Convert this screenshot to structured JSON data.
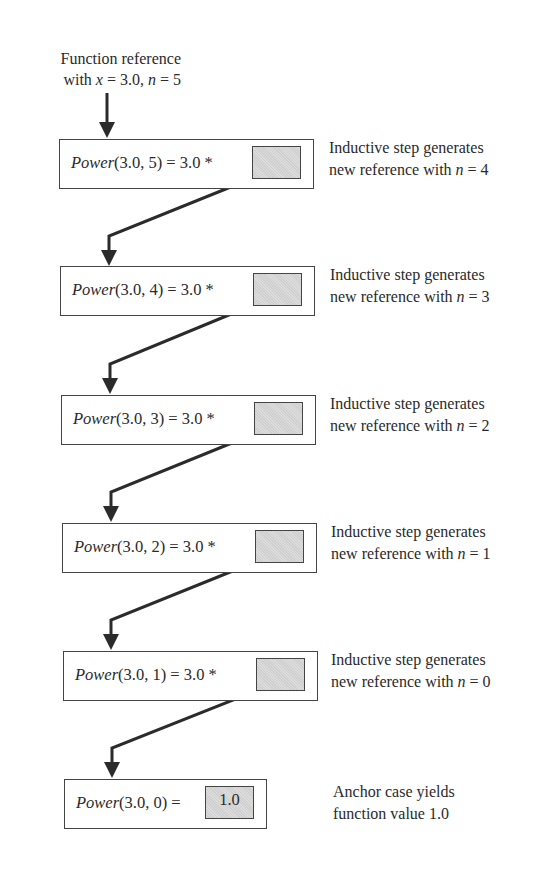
{
  "intro": {
    "line1": "Function reference",
    "line2_prefix": "with ",
    "var_x": "x",
    "x_eq": " = 3.0, ",
    "var_n": "n",
    "n_eq": " = 5"
  },
  "steps": [
    {
      "fn": "Power",
      "args": "(3.0, 5) = 3.0 *",
      "note_line1": "Inductive step generates",
      "note_line2_prefix": "new reference with ",
      "var": "n",
      "note_line2_suffix": " = 4"
    },
    {
      "fn": "Power",
      "args": "(3.0, 4) = 3.0 *",
      "note_line1": "Inductive step generates",
      "note_line2_prefix": "new reference with ",
      "var": "n",
      "note_line2_suffix": " = 3"
    },
    {
      "fn": "Power",
      "args": "(3.0, 3) = 3.0 *",
      "note_line1": "Inductive step generates",
      "note_line2_prefix": "new reference with ",
      "var": "n",
      "note_line2_suffix": " = 2"
    },
    {
      "fn": "Power",
      "args": "(3.0, 2) = 3.0 *",
      "note_line1": "Inductive step generates",
      "note_line2_prefix": "new reference with ",
      "var": "n",
      "note_line2_suffix": " = 1"
    },
    {
      "fn": "Power",
      "args": "(3.0, 1) = 3.0 *",
      "note_line1": "Inductive step generates",
      "note_line2_prefix": "new reference with ",
      "var": "n",
      "note_line2_suffix": " = 0"
    }
  ],
  "anchor": {
    "fn": "Power",
    "args": "(3.0, 0) =",
    "value": "1.0",
    "note_line1": "Anchor case yields",
    "note_line2": "function value 1.0"
  },
  "colors": {
    "line": "#2b2b2b",
    "slot_fill": "#d6d6d6",
    "box_border": "#444444"
  }
}
